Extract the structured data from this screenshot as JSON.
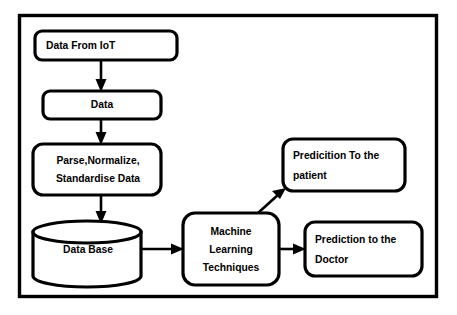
{
  "diagram": {
    "background_color": "#ffffff",
    "line_color": "#000000",
    "nodes": {
      "data_from_iot": {
        "label": "Data From IoT",
        "shape": "rounded-rectangle"
      },
      "data": {
        "label": "Data",
        "shape": "rounded-rectangle"
      },
      "parse_normalize": {
        "line1": "Parse,Normalize,",
        "line2": "Standardise Data",
        "shape": "rounded-rectangle"
      },
      "database": {
        "label": "Data Base",
        "shape": "cylinder"
      },
      "ml_techniques": {
        "line1": "Machine",
        "line2": "Learning",
        "line3": "Techniques",
        "shape": "rounded-rectangle"
      },
      "prediction_patient": {
        "line1": "Predicition To the",
        "line2": "patient",
        "shape": "rounded-rectangle"
      },
      "prediction_doctor": {
        "line1": "Prediction to the",
        "line2": "Doctor",
        "shape": "rounded-rectangle"
      }
    },
    "edges": [
      {
        "from": "data_from_iot",
        "to": "data",
        "direction": "down"
      },
      {
        "from": "data",
        "to": "parse_normalize",
        "direction": "down"
      },
      {
        "from": "parse_normalize",
        "to": "database",
        "direction": "down"
      },
      {
        "from": "database",
        "to": "ml_techniques",
        "direction": "right"
      },
      {
        "from": "ml_techniques",
        "to": "prediction_patient",
        "direction": "diagonal-up-right"
      },
      {
        "from": "ml_techniques",
        "to": "prediction_doctor",
        "direction": "right"
      }
    ]
  }
}
